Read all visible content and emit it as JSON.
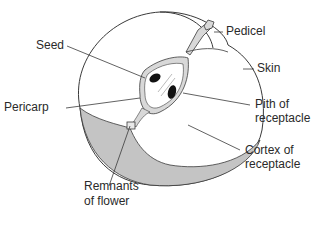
{
  "diagram": {
    "colors": {
      "outline": "#3a3a3a",
      "pericarp_fill": "#c4c4c4",
      "seed_fill": "#111111",
      "background": "#ffffff"
    },
    "labels": {
      "seed": "Seed",
      "pedicel": "Pedicel",
      "skin": "Skin",
      "pericarp": "Pericarp",
      "pith_line1": "Pith of",
      "pith_line2": "receptacle",
      "cortex_line1": "Cortex of",
      "cortex_line2": "receptacle",
      "remnants_line1": "Remnants",
      "remnants_line2": "of flower"
    }
  }
}
